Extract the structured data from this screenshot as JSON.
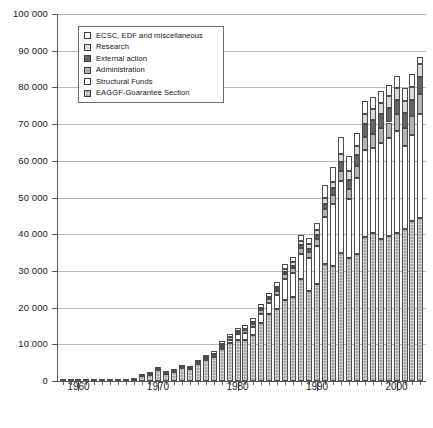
{
  "legend": {
    "position": "top-left-inside",
    "entries": [
      {
        "label": "ECSC, EDF and miscellaneous",
        "key": "ecsc",
        "swatch_class": "sw-ecsc",
        "color": "#ffffff"
      },
      {
        "label": "Research",
        "key": "research",
        "swatch_class": "sw-research",
        "color": "#e2e2e2"
      },
      {
        "label": "External action",
        "key": "extern",
        "swatch_class": "sw-extern",
        "color": "#646464"
      },
      {
        "label": "Administration",
        "key": "admin",
        "swatch_class": "sw-admin",
        "color": "#b4b4b4"
      },
      {
        "label": "Structural Funds",
        "key": "struct",
        "swatch_class": "sw-struct",
        "color": "#ffffff"
      },
      {
        "label": "EAGGF-Guarantee Section",
        "key": "eaggf",
        "swatch_class": "sw-eaggf",
        "color": "#a8a8a8"
      }
    ]
  },
  "caption": {
    "text": ""
  },
  "chart_data": {
    "type": "bar",
    "subtype": "stacked-vertical",
    "title": "",
    "subtitle": "",
    "xlabel": "",
    "ylabel": "",
    "ylim": [
      0,
      100000
    ],
    "ytick_step": 10000,
    "ytick_labels": [
      "0",
      "10 000",
      "20 000",
      "30 000",
      "40 000",
      "50 000",
      "60 000",
      "70 000",
      "80 000",
      "90 000",
      "100 000"
    ],
    "ytick_values": [
      0,
      10000,
      20000,
      30000,
      40000,
      50000,
      60000,
      70000,
      80000,
      90000,
      100000
    ],
    "grid": "horizontal",
    "xlim": [
      1957.3,
      2003.7
    ],
    "xtick_major_labels": [
      "1960",
      "1970",
      "1980",
      "1990",
      "2000"
    ],
    "xtick_major_values": [
      1960,
      1970,
      1980,
      1990,
      2000
    ],
    "x": [
      1958,
      1959,
      1960,
      1961,
      1962,
      1963,
      1964,
      1965,
      1966,
      1967,
      1968,
      1969,
      1970,
      1971,
      1972,
      1973,
      1974,
      1975,
      1976,
      1977,
      1978,
      1979,
      1980,
      1981,
      1982,
      1983,
      1984,
      1985,
      1986,
      1987,
      1988,
      1989,
      1990,
      1991,
      1992,
      1993,
      1994,
      1995,
      1996,
      1997,
      1998,
      1999,
      2000,
      2001,
      2002,
      2003
    ],
    "stack_order_bottom_to_top": [
      "eaggf",
      "struct",
      "admin",
      "extern",
      "research",
      "ecsc"
    ],
    "series": [
      {
        "name": "EAGGF-Guarantee Section",
        "key": "eaggf",
        "values": [
          0,
          0,
          0,
          0,
          0,
          0,
          0,
          0,
          0,
          0,
          1259,
          1669,
          3108,
          1884,
          2478,
          3615,
          3177,
          4530,
          5637,
          6464,
          8673,
          10441,
          11292,
          11141,
          12406,
          15812,
          18330,
          19728,
          22137,
          22950,
          27687,
          24408,
          26454,
          31804,
          31311,
          34748,
          33592,
          34490,
          39108,
          40423,
          38748,
          39541,
          40467,
          41534,
          43520,
          44378
        ]
      },
      {
        "name": "Structural Funds",
        "key": "struct",
        "values": [
          0,
          0,
          0,
          0,
          0,
          0,
          0,
          0,
          0,
          0,
          0,
          0,
          0,
          0,
          0,
          0,
          0,
          0,
          0,
          0,
          0,
          0,
          0,
          0,
          0,
          0,
          0,
          0,
          0,
          0,
          0,
          0,
          0,
          0,
          0,
          0,
          0,
          0,
          0,
          0,
          0,
          0,
          0,
          0,
          0,
          0
        ]
      },
      {
        "name": "Administration",
        "key": "admin",
        "values": [
          0,
          0,
          0,
          0,
          0,
          0,
          0,
          0,
          0,
          0,
          0,
          0,
          0,
          0,
          0,
          0,
          0,
          0,
          0,
          0,
          0,
          0,
          0,
          0,
          0,
          0,
          0,
          0,
          0,
          0,
          0,
          0,
          0,
          0,
          0,
          0,
          0,
          0,
          0,
          0,
          0,
          0,
          0,
          0,
          0,
          0
        ]
      },
      {
        "name": "External action",
        "key": "extern",
        "values": [
          0,
          0,
          0,
          0,
          0,
          0,
          0,
          0,
          0,
          0,
          0,
          0,
          0,
          0,
          0,
          0,
          0,
          0,
          0,
          0,
          0,
          0,
          0,
          0,
          0,
          0,
          0,
          0,
          0,
          0,
          0,
          0,
          0,
          0,
          0,
          0,
          0,
          0,
          0,
          0,
          0,
          0,
          0,
          0,
          0,
          0
        ]
      },
      {
        "name": "Research",
        "key": "research",
        "values": [
          0,
          0,
          0,
          0,
          0,
          0,
          0,
          0,
          0,
          0,
          0,
          0,
          0,
          0,
          0,
          0,
          0,
          0,
          0,
          0,
          0,
          0,
          0,
          0,
          0,
          0,
          0,
          0,
          0,
          0,
          0,
          0,
          0,
          0,
          0,
          0,
          0,
          0,
          0,
          0,
          0,
          0,
          0,
          0,
          0,
          0
        ]
      },
      {
        "name": "ECSC, EDF and miscellaneous",
        "key": "ecsc",
        "values": [
          0,
          0,
          0,
          0,
          0,
          0,
          0,
          0,
          0,
          0,
          0,
          0,
          0,
          0,
          0,
          0,
          0,
          0,
          0,
          0,
          0,
          0,
          0,
          0,
          0,
          0,
          0,
          0,
          0,
          0,
          0,
          0,
          0,
          0,
          0,
          0,
          0,
          0,
          0,
          0,
          0,
          0,
          0,
          0,
          0,
          0
        ]
      }
    ],
    "stacks": [
      {
        "year": 1958,
        "eaggf": 0,
        "struct": 0,
        "admin": 7,
        "extern": 0,
        "research": 0,
        "ecsc": 0,
        "total": 7
      },
      {
        "year": 1959,
        "eaggf": 0,
        "struct": 0,
        "admin": 18,
        "extern": 0,
        "research": 0,
        "ecsc": 0,
        "total": 18
      },
      {
        "year": 1960,
        "eaggf": 0,
        "struct": 0,
        "admin": 24,
        "extern": 0,
        "research": 10,
        "ecsc": 0,
        "total": 34
      },
      {
        "year": 1961,
        "eaggf": 0,
        "struct": 0,
        "admin": 28,
        "extern": 0,
        "research": 20,
        "ecsc": 0,
        "total": 48
      },
      {
        "year": 1962,
        "eaggf": 0,
        "struct": 0,
        "admin": 32,
        "extern": 0,
        "research": 46,
        "ecsc": 0,
        "total": 78
      },
      {
        "year": 1963,
        "eaggf": 0,
        "struct": 0,
        "admin": 36,
        "extern": 0,
        "research": 62,
        "ecsc": 0,
        "total": 98
      },
      {
        "year": 1964,
        "eaggf": 0,
        "struct": 0,
        "admin": 40,
        "extern": 0,
        "research": 78,
        "ecsc": 0,
        "total": 118
      },
      {
        "year": 1965,
        "eaggf": 28,
        "struct": 0,
        "admin": 46,
        "extern": 0,
        "research": 86,
        "ecsc": 0,
        "total": 160
      },
      {
        "year": 1966,
        "eaggf": 52,
        "struct": 0,
        "admin": 52,
        "extern": 0,
        "research": 90,
        "ecsc": 0,
        "total": 194
      },
      {
        "year": 1967,
        "eaggf": 240,
        "struct": 0,
        "admin": 58,
        "extern": 0,
        "research": 95,
        "ecsc": 0,
        "total": 393
      },
      {
        "year": 1968,
        "eaggf": 1259,
        "struct": 0,
        "admin": 66,
        "extern": 0,
        "research": 96,
        "ecsc": 170,
        "total": 1591
      },
      {
        "year": 1969,
        "eaggf": 1669,
        "struct": 0,
        "admin": 74,
        "extern": 0,
        "research": 66,
        "ecsc": 330,
        "total": 2139
      },
      {
        "year": 1970,
        "eaggf": 3108,
        "struct": 0,
        "admin": 86,
        "extern": 0,
        "research": 62,
        "ecsc": 370,
        "total": 3626
      },
      {
        "year": 1971,
        "eaggf": 1884,
        "struct": 0,
        "admin": 100,
        "extern": 0,
        "research": 64,
        "ecsc": 250,
        "total": 2298
      },
      {
        "year": 1972,
        "eaggf": 2478,
        "struct": 0,
        "admin": 120,
        "extern": 0,
        "research": 70,
        "ecsc": 290,
        "total": 2958
      },
      {
        "year": 1973,
        "eaggf": 3615,
        "struct": 0,
        "admin": 240,
        "extern": 0,
        "research": 70,
        "ecsc": 410,
        "total": 4335
      },
      {
        "year": 1974,
        "eaggf": 3177,
        "struct": 0,
        "admin": 300,
        "extern": 0,
        "research": 80,
        "ecsc": 500,
        "total": 4057
      },
      {
        "year": 1975,
        "eaggf": 4530,
        "struct": 150,
        "admin": 350,
        "extern": 0,
        "research": 90,
        "ecsc": 560,
        "total": 5680
      },
      {
        "year": 1976,
        "eaggf": 5637,
        "struct": 290,
        "admin": 420,
        "extern": 0,
        "research": 100,
        "ecsc": 600,
        "total": 7047
      },
      {
        "year": 1977,
        "eaggf": 6464,
        "struct": 400,
        "admin": 500,
        "extern": 0,
        "research": 130,
        "ecsc": 700,
        "total": 8194
      },
      {
        "year": 1978,
        "eaggf": 8673,
        "struct": 600,
        "admin": 580,
        "extern": 0,
        "research": 160,
        "ecsc": 780,
        "total": 10793
      },
      {
        "year": 1979,
        "eaggf": 10441,
        "struct": 800,
        "admin": 660,
        "extern": 0,
        "research": 190,
        "ecsc": 850,
        "total": 12941
      },
      {
        "year": 1980,
        "eaggf": 11292,
        "struct": 1400,
        "admin": 760,
        "extern": 0,
        "research": 210,
        "ecsc": 900,
        "total": 14562
      },
      {
        "year": 1981,
        "eaggf": 11141,
        "struct": 1900,
        "admin": 840,
        "extern": 130,
        "research": 230,
        "ecsc": 950,
        "total": 15191
      },
      {
        "year": 1982,
        "eaggf": 12406,
        "struct": 2300,
        "admin": 920,
        "extern": 180,
        "research": 250,
        "ecsc": 1000,
        "total": 17056
      },
      {
        "year": 1983,
        "eaggf": 15812,
        "struct": 2500,
        "admin": 1000,
        "extern": 220,
        "research": 280,
        "ecsc": 1050,
        "total": 20862
      },
      {
        "year": 1984,
        "eaggf": 18330,
        "struct": 2900,
        "admin": 1100,
        "extern": 280,
        "research": 330,
        "ecsc": 1100,
        "total": 24040
      },
      {
        "year": 1985,
        "eaggf": 19728,
        "struct": 3700,
        "admin": 1200,
        "extern": 340,
        "research": 680,
        "ecsc": 1200,
        "total": 26848
      },
      {
        "year": 1986,
        "eaggf": 22137,
        "struct": 5700,
        "admin": 1350,
        "extern": 480,
        "research": 760,
        "ecsc": 1400,
        "total": 31827
      },
      {
        "year": 1987,
        "eaggf": 22950,
        "struct": 6400,
        "admin": 1450,
        "extern": 560,
        "research": 960,
        "ecsc": 1500,
        "total": 33820
      },
      {
        "year": 1988,
        "eaggf": 27687,
        "struct": 7000,
        "admin": 1600,
        "extern": 700,
        "research": 1130,
        "ecsc": 1600,
        "total": 39717
      },
      {
        "year": 1989,
        "eaggf": 24408,
        "struct": 9000,
        "admin": 1750,
        "extern": 840,
        "research": 1350,
        "ecsc": 1700,
        "total": 39048
      },
      {
        "year": 1990,
        "eaggf": 26454,
        "struct": 10300,
        "admin": 1900,
        "extern": 1050,
        "research": 1450,
        "ecsc": 2000,
        "total": 43154
      },
      {
        "year": 1991,
        "eaggf": 31804,
        "struct": 13000,
        "admin": 2100,
        "extern": 1450,
        "research": 1600,
        "ecsc": 3500,
        "total": 53454
      },
      {
        "year": 1992,
        "eaggf": 31311,
        "struct": 17000,
        "admin": 2350,
        "extern": 1800,
        "research": 1800,
        "ecsc": 4000,
        "total": 58261
      },
      {
        "year": 1993,
        "eaggf": 34748,
        "struct": 19800,
        "admin": 2600,
        "extern": 2400,
        "research": 2200,
        "ecsc": 4800,
        "total": 66548
      },
      {
        "year": 1994,
        "eaggf": 33592,
        "struct": 16000,
        "admin": 2800,
        "extern": 2500,
        "research": 2400,
        "ecsc": 3900,
        "total": 61192
      },
      {
        "year": 1995,
        "eaggf": 34490,
        "struct": 20800,
        "admin": 3200,
        "extern": 3000,
        "research": 2500,
        "ecsc": 3700,
        "total": 67690
      },
      {
        "year": 1996,
        "eaggf": 39108,
        "struct": 23800,
        "admin": 3600,
        "extern": 3500,
        "research": 2700,
        "ecsc": 3500,
        "total": 76208
      },
      {
        "year": 1997,
        "eaggf": 40423,
        "struct": 23200,
        "admin": 3800,
        "extern": 3800,
        "research": 2900,
        "ecsc": 3400,
        "total": 77523
      },
      {
        "year": 1998,
        "eaggf": 38748,
        "struct": 26000,
        "admin": 4100,
        "extern": 3900,
        "research": 3000,
        "ecsc": 3300,
        "total": 79048
      },
      {
        "year": 1999,
        "eaggf": 39541,
        "struct": 26600,
        "admin": 4300,
        "extern": 4000,
        "research": 3100,
        "ecsc": 3100,
        "total": 80641
      },
      {
        "year": 2000,
        "eaggf": 40467,
        "struct": 27600,
        "admin": 4700,
        "extern": 3900,
        "research": 3200,
        "ecsc": 3200,
        "total": 83067
      },
      {
        "year": 2001,
        "eaggf": 41534,
        "struct": 22500,
        "admin": 4900,
        "extern": 4200,
        "research": 3300,
        "ecsc": 3500,
        "total": 79934
      },
      {
        "year": 2002,
        "eaggf": 43520,
        "struct": 23500,
        "admin": 5200,
        "extern": 4400,
        "research": 3400,
        "ecsc": 3600,
        "total": 83620
      },
      {
        "year": 2003,
        "eaggf": 44378,
        "struct": 28500,
        "admin": 5400,
        "extern": 4600,
        "research": 3500,
        "ecsc": 2000,
        "total": 88378
      }
    ]
  }
}
